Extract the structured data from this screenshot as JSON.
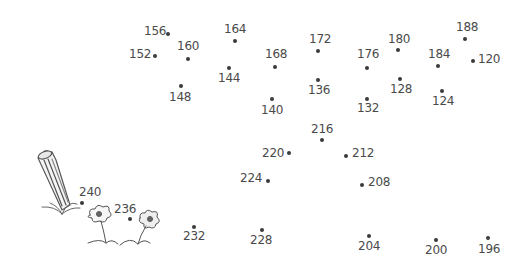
{
  "puzzle": {
    "type": "connect-the-dots",
    "colors": {
      "dot": "#3a3a3a",
      "label": "#4a4a4a",
      "sketch": "#555555",
      "background": "#ffffff"
    },
    "points": [
      {
        "n": "120",
        "dx": 473,
        "dy": 61,
        "lx": 478,
        "ly": 53
      },
      {
        "n": "124",
        "dx": 442,
        "dy": 91,
        "lx": 432,
        "ly": 95
      },
      {
        "n": "128",
        "dx": 400,
        "dy": 79,
        "lx": 390,
        "ly": 83
      },
      {
        "n": "132",
        "dx": 367,
        "dy": 99,
        "lx": 357,
        "ly": 102
      },
      {
        "n": "136",
        "dx": 318,
        "dy": 80,
        "lx": 308,
        "ly": 84
      },
      {
        "n": "140",
        "dx": 272,
        "dy": 99,
        "lx": 261,
        "ly": 104
      },
      {
        "n": "144",
        "dx": 229,
        "dy": 68,
        "lx": 218,
        "ly": 72
      },
      {
        "n": "148",
        "dx": 181,
        "dy": 86,
        "lx": 169,
        "ly": 91
      },
      {
        "n": "152",
        "dx": 155,
        "dy": 56,
        "lx": 129,
        "ly": 48
      },
      {
        "n": "156",
        "dx": 168,
        "dy": 34,
        "lx": 144,
        "ly": 25
      },
      {
        "n": "160",
        "dx": 188,
        "dy": 59,
        "lx": 177,
        "ly": 40
      },
      {
        "n": "164",
        "dx": 235,
        "dy": 41,
        "lx": 224,
        "ly": 23
      },
      {
        "n": "168",
        "dx": 275,
        "dy": 67,
        "lx": 265,
        "ly": 48
      },
      {
        "n": "172",
        "dx": 318,
        "dy": 51,
        "lx": 309,
        "ly": 33
      },
      {
        "n": "176",
        "dx": 367,
        "dy": 68,
        "lx": 357,
        "ly": 48
      },
      {
        "n": "180",
        "dx": 398,
        "dy": 50,
        "lx": 388,
        "ly": 33
      },
      {
        "n": "184",
        "dx": 438,
        "dy": 66,
        "lx": 428,
        "ly": 48
      },
      {
        "n": "188",
        "dx": 465,
        "dy": 39,
        "lx": 456,
        "ly": 21
      },
      {
        "n": "196",
        "dx": 488,
        "dy": 238,
        "lx": 478,
        "ly": 243
      },
      {
        "n": "200",
        "dx": 436,
        "dy": 240,
        "lx": 425,
        "ly": 244
      },
      {
        "n": "204",
        "dx": 369,
        "dy": 236,
        "lx": 358,
        "ly": 240
      },
      {
        "n": "208",
        "dx": 362,
        "dy": 185,
        "lx": 368,
        "ly": 176
      },
      {
        "n": "212",
        "dx": 346,
        "dy": 156,
        "lx": 352,
        "ly": 147
      },
      {
        "n": "216",
        "dx": 322,
        "dy": 140,
        "lx": 311,
        "ly": 123
      },
      {
        "n": "220",
        "dx": 289,
        "dy": 153,
        "lx": 262,
        "ly": 147
      },
      {
        "n": "224",
        "dx": 268,
        "dy": 181,
        "lx": 240,
        "ly": 172
      },
      {
        "n": "228",
        "dx": 262,
        "dy": 230,
        "lx": 250,
        "ly": 234
      },
      {
        "n": "232",
        "dx": 194,
        "dy": 227,
        "lx": 183,
        "ly": 230
      },
      {
        "n": "236",
        "dx": 130,
        "dy": 219,
        "lx": 114,
        "ly": 203
      },
      {
        "n": "240",
        "dx": 82,
        "dy": 203,
        "lx": 79,
        "ly": 186
      }
    ]
  }
}
